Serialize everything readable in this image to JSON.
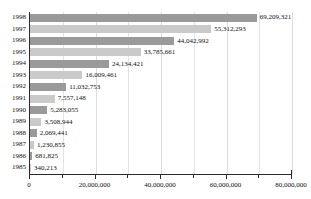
{
  "chart_data": {
    "type": "bar",
    "orientation": "horizontal",
    "title": "",
    "xlabel": "",
    "ylabel": "",
    "xlim": [
      0,
      80000000
    ],
    "ylim": null,
    "grid": true,
    "legend": null,
    "categories": [
      "1998",
      "1997",
      "1996",
      "1995",
      "1994",
      "1993",
      "1992",
      "1991",
      "1990",
      "1989",
      "1988",
      "1987",
      "1986",
      "1985"
    ],
    "values": [
      69209321,
      55312293,
      44042992,
      33785661,
      24134421,
      16009461,
      11032753,
      7557148,
      5283055,
      3508944,
      2069441,
      1230855,
      681825,
      340213
    ],
    "value_labels": [
      "69,209,321",
      "55,312,293",
      "44,042,992",
      "33,785,661",
      "24,134,421",
      "16,009,461",
      "11,032,753",
      "7,557,148",
      "5,283,055",
      "3,508,944",
      "2,069,441",
      "1,230,855",
      "681,825",
      "340,213"
    ],
    "xticks": [
      0,
      20000000,
      40000000,
      60000000,
      80000000
    ],
    "xtick_labels": [
      "0",
      "20,000,000",
      "40,000,000",
      "60,000,000",
      "80,000,000"
    ],
    "xticks_minor": [
      10000000,
      30000000,
      50000000,
      70000000
    ],
    "bar_colors": [
      "#9a9a9a",
      "#cacaca"
    ]
  },
  "axis": {
    "x_labels": [
      "0",
      "20,000,000",
      "40,000,000",
      "60,000,000",
      "80,000,000"
    ],
    "y_labels": [
      "1998",
      "1997",
      "1996",
      "1995",
      "1994",
      "1993",
      "1992",
      "1991",
      "1990",
      "1989",
      "1988",
      "1987",
      "1986",
      "1985"
    ]
  }
}
